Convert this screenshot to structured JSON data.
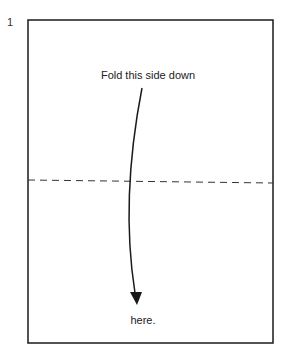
{
  "step_number": "1",
  "labels": {
    "top": "Fold this side down",
    "bottom": "here."
  },
  "colors": {
    "line": "#1a1a1a"
  }
}
